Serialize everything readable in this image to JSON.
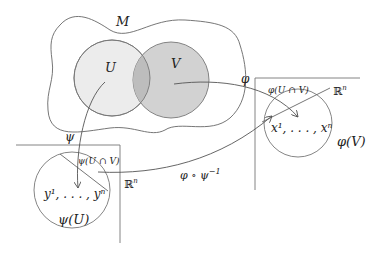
{
  "diagram": {
    "manifold_label": "M",
    "set_u_label": "U",
    "set_v_label": "V",
    "map_phi_label": "φ",
    "map_psi_label": "ψ",
    "transition_label": "φ ∘ ψ",
    "transition_exp": "−1",
    "right_chart": {
      "space_label": "ℝ",
      "space_exp": "n",
      "intersection_label": "φ(U ∩ V)",
      "coords_label": "x¹, . . . , xⁿ",
      "image_label": "φ(V)"
    },
    "left_chart": {
      "space_label": "ℝ",
      "space_exp": "n",
      "intersection_label": "ψ(U ∩ V)",
      "coords_label": "y¹, . . . , yⁿ",
      "image_label": "ψ(U)"
    },
    "colors": {
      "u_fill": "#ececec",
      "v_fill": "#d2d2d2",
      "overlap_fill": "#bdbdbd",
      "stroke": "#666666"
    }
  }
}
